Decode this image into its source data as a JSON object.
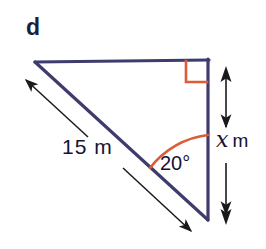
{
  "figure": {
    "part_label": "d",
    "shape": "right-triangle",
    "colors": {
      "triangle_stroke": "#3e3b6d",
      "annotation_orange": "#dd5b36",
      "dimension_black": "#1a1a1a",
      "text": "#141432",
      "background": "#ffffff"
    },
    "labels": {
      "hypotenuse_length": "15 m",
      "angle": "20°",
      "height_variable": "x",
      "height_unit": "m"
    },
    "markers": {
      "right_angle": "right-angle-square",
      "angle_arc": "arc-20-degrees"
    },
    "geometry": {
      "vertex_top_left": [
        35,
        62
      ],
      "vertex_top_right": [
        208,
        60
      ],
      "vertex_bottom_right": [
        208,
        219
      ],
      "right_angle_at": "top-right",
      "angle_20_at": "bottom-right",
      "hypotenuse": "top-left to bottom-right",
      "height_side": "top-right to bottom-right"
    }
  }
}
